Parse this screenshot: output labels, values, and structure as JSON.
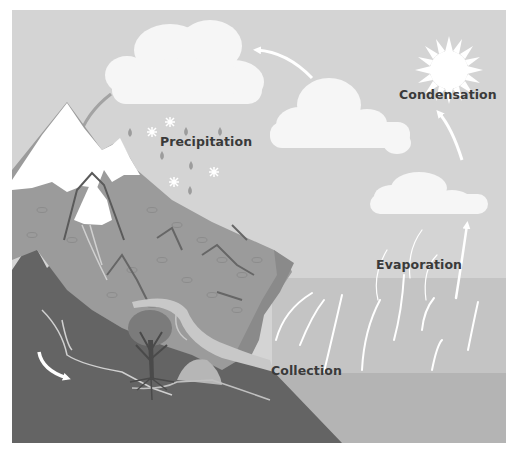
{
  "diagram": {
    "type": "water-cycle-illustration",
    "labels": {
      "precipitation": "Precipitation",
      "condensation": "Condensation",
      "evaporation": "Evaporation",
      "collection": "Collection"
    },
    "stages": [
      {
        "id": "precipitation",
        "label": "Precipitation",
        "position": "under left cloud, beside rain and snowflakes"
      },
      {
        "id": "condensation",
        "label": "Condensation",
        "position": "right sky, between clouds"
      },
      {
        "id": "evaporation",
        "label": "Evaporation",
        "position": "above sea, with rising vapor arrows"
      },
      {
        "id": "collection",
        "label": "Collection",
        "position": "at sea surface near river mouth"
      }
    ],
    "elements": [
      "sun",
      "rain cloud",
      "cloud middle",
      "cloud small right",
      "snow-capped mountain",
      "hills",
      "river",
      "tree with roots",
      "groundwater arrow",
      "sea",
      "vapor arrows",
      "cycle arrows"
    ],
    "colors": {
      "sky": "#d4d4d4",
      "cloud": "#f6f6f6",
      "snow": "#ffffff",
      "mountain": "#9a9a9a",
      "hill_dark": "#6e6e6e",
      "ground_dark": "#626262",
      "river": "#c9c9c9",
      "sea_upper": "#c3c3c3",
      "sea_lower": "#b3b3b3",
      "tree_canopy": "#7c7c7c",
      "tree_trunk": "#4a4a4a",
      "drops": "#9c9c9c",
      "text": "#3a3a3a",
      "arrow_dark": "#a0a0a0",
      "arrow_light": "#ffffff"
    }
  }
}
